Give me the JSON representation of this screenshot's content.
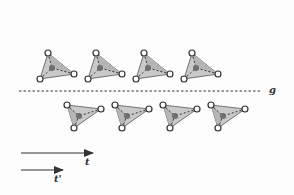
{
  "diagram": {
    "labels": {
      "glide_plane": "g",
      "translation": "t",
      "translation_prime": "t'"
    },
    "colors": {
      "face": "#c8c8c8",
      "face_dark": "#a9a9a9",
      "edge": "#333333",
      "center_atom": "#6e6e6e",
      "vertex_fill": "#ffffff"
    },
    "top_row_offsets_x": [
      0,
      48,
      96,
      144
    ],
    "bottom_row_offsets_x": [
      0,
      48,
      96,
      144
    ],
    "glide_line": {
      "x1": 19,
      "x2": 262,
      "y": 91
    }
  }
}
